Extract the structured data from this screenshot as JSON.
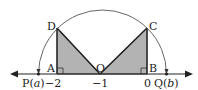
{
  "diagram": {
    "points": {
      "A": "A",
      "B": "B",
      "C": "C",
      "D": "D",
      "O": "O",
      "P_prefix": "P(",
      "P_var": "a",
      "P_suffix": ")",
      "Q_prefix": "Q(",
      "Q_var": "b",
      "Q_suffix": ")"
    },
    "ticks": {
      "minus2": "−2",
      "minus1": "−1",
      "zero": "0"
    },
    "colors": {
      "shade": "#b3b3b3",
      "line": "#333333",
      "arc": "#555555"
    }
  }
}
